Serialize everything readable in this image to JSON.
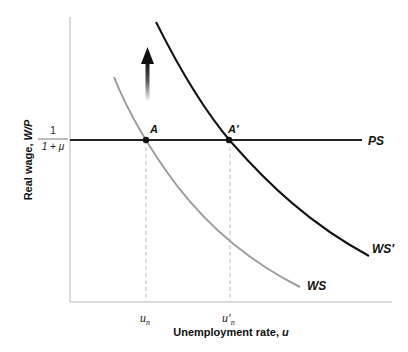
{
  "diagram": {
    "x_axis_label": "Unemployment rate, u",
    "x_axis_label_main": "Unemployment rate, ",
    "x_axis_label_var": "u",
    "y_axis_label": "Real wage, W/P",
    "y_axis_label_main": "Real wage, ",
    "y_axis_label_var": "W/P",
    "y_tick": {
      "numerator": "1",
      "denominator": "1 + μ"
    },
    "x_ticks": [
      {
        "label": "u",
        "sub": "n"
      },
      {
        "label": "u′",
        "sub": "n"
      }
    ],
    "curves": {
      "ps": {
        "label": "PS",
        "color": "#222222"
      },
      "ws": {
        "label": "WS",
        "color": "#9a9a9a"
      },
      "ws_prime": {
        "label": "WS′",
        "color": "#111111"
      }
    },
    "points": [
      {
        "label": "A"
      },
      {
        "label": "A′"
      }
    ],
    "arrow": {
      "direction": "up",
      "meaning": "shift of wage-setting curve"
    },
    "colors": {
      "axis": "#cfcfcf",
      "dashed": "#bdbdbd"
    }
  }
}
